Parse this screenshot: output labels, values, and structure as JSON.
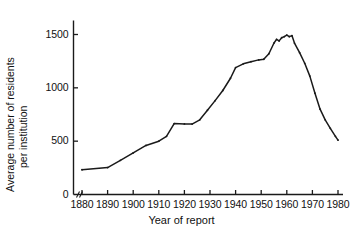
{
  "chart_data": {
    "type": "line",
    "title": "",
    "xlabel": "Year of report",
    "ylabel": "Average number of residents per institution",
    "ylabel_line1": "Aᴠerage number of residents",
    "ylabel_line2": "per institution",
    "xlim": [
      1878,
      1982
    ],
    "ylim": [
      0,
      1600
    ],
    "xticks": [
      1880,
      1890,
      1900,
      1910,
      1920,
      1930,
      1940,
      1950,
      1960,
      1970,
      1980
    ],
    "yticks": [
      0,
      500,
      1000,
      1500
    ],
    "xtick_labels": [
      "1880",
      "1890",
      "1900",
      "1910",
      "1920",
      "1930",
      "1940",
      "1950",
      "1960",
      "1970",
      "1980"
    ],
    "ytick_labels": [
      "0",
      "500",
      "1000",
      "1500"
    ],
    "grid": false,
    "legend": false,
    "axis_break_x": true,
    "line_color": "#1a1a1a",
    "background_color": "#ffffff",
    "series": [
      {
        "name": "Average number of residents per institution",
        "x": [
          1880,
          1890,
          1895,
          1900,
          1905,
          1910,
          1913,
          1916,
          1920,
          1923,
          1926,
          1929,
          1932,
          1935,
          1938,
          1940,
          1943,
          1946,
          1949,
          1951,
          1953,
          1955,
          1956,
          1957,
          1958,
          1959,
          1960,
          1961,
          1962,
          1963,
          1965,
          1967,
          1969,
          1971,
          1973,
          1975,
          1977,
          1979,
          1980
        ],
        "y": [
          232,
          252,
          320,
          390,
          460,
          500,
          545,
          665,
          662,
          660,
          700,
          790,
          880,
          975,
          1090,
          1190,
          1225,
          1245,
          1262,
          1268,
          1320,
          1420,
          1455,
          1440,
          1470,
          1480,
          1495,
          1480,
          1490,
          1420,
          1330,
          1230,
          1110,
          950,
          800,
          700,
          620,
          545,
          510
        ]
      }
    ]
  }
}
